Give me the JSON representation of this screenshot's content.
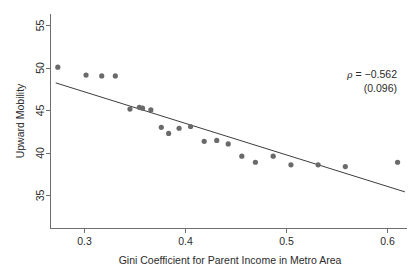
{
  "chart_data": {
    "type": "scatter",
    "title": "",
    "xlabel": "Gini Coefficient for Parent Income in Metro Area",
    "ylabel": "Upward Mobility",
    "xlim": [
      0.272,
      0.613
    ],
    "ylim": [
      32.2,
      56.8
    ],
    "xticks": [
      0.3,
      0.4,
      0.5,
      0.6
    ],
    "xticklabels": [
      "0.3",
      "0.4",
      "0.5",
      "0.6"
    ],
    "yticks": [
      35,
      40,
      45,
      50,
      55
    ],
    "yticklabels": [
      "35",
      "40",
      "45",
      "50",
      "55"
    ],
    "grid": false,
    "legend": null,
    "marker_color": "#6a6a6a",
    "line_color": "#3d3d3d",
    "points": [
      {
        "x": 0.279,
        "y": 50.7
      },
      {
        "x": 0.306,
        "y": 49.8
      },
      {
        "x": 0.321,
        "y": 49.7
      },
      {
        "x": 0.334,
        "y": 49.7
      },
      {
        "x": 0.348,
        "y": 45.9
      },
      {
        "x": 0.357,
        "y": 46.1
      },
      {
        "x": 0.36,
        "y": 46.0
      },
      {
        "x": 0.368,
        "y": 45.8
      },
      {
        "x": 0.378,
        "y": 43.8
      },
      {
        "x": 0.385,
        "y": 43.1
      },
      {
        "x": 0.395,
        "y": 43.7
      },
      {
        "x": 0.406,
        "y": 43.9
      },
      {
        "x": 0.419,
        "y": 42.2
      },
      {
        "x": 0.431,
        "y": 42.3
      },
      {
        "x": 0.442,
        "y": 41.9
      },
      {
        "x": 0.455,
        "y": 40.5
      },
      {
        "x": 0.468,
        "y": 39.8
      },
      {
        "x": 0.485,
        "y": 40.5
      },
      {
        "x": 0.502,
        "y": 39.5
      },
      {
        "x": 0.528,
        "y": 39.5
      },
      {
        "x": 0.554,
        "y": 39.3
      },
      {
        "x": 0.604,
        "y": 39.8
      }
    ],
    "fit_line": {
      "x_start": 0.277,
      "y_start": 48.9,
      "x_end": 0.611,
      "y_end": 36.4
    },
    "annotations": [
      {
        "name": "correlation",
        "symbol": "ρ",
        "text": "ρ = −0.562"
      },
      {
        "name": "standard-error",
        "text": "(0.096)"
      }
    ]
  },
  "annotation_block": {
    "rho_symbol": "ρ",
    "rho_value": " = −0.562",
    "se_value": "(0.096)"
  }
}
